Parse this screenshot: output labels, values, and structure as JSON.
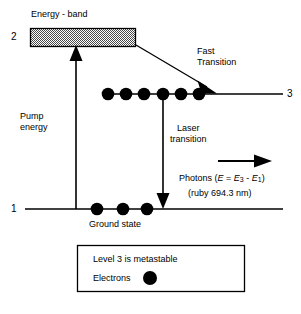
{
  "diagram": {
    "title_text": "Energy - band",
    "levels": [
      {
        "id": "level-2",
        "label": "2"
      },
      {
        "id": "level-3",
        "label": "3"
      },
      {
        "id": "level-1",
        "label": "1"
      }
    ],
    "annotations": {
      "energy_band": "Energy - band",
      "pump_energy_line1": "Pump",
      "pump_energy_line2": "energy",
      "fast_transition_line1": "Fast",
      "fast_transition_line2": "Transition",
      "laser_transition_line1": "Laser",
      "laser_transition_line2": "transition",
      "ground_state": "Ground state",
      "photons_prefix": "Photons (",
      "photons_e": "E",
      "photons_eq": " = ",
      "photons_e3": "E",
      "photons_sub3": "3",
      "photons_minus": " - ",
      "photons_e1": "E",
      "photons_sub1": "1",
      "photons_suffix": ")",
      "ruby_wavelength": "(ruby 694.3 nm)"
    },
    "legend": {
      "line1": "Level 3 is metastable",
      "line2": "Electrons",
      "electron_marker": "filled-circle"
    },
    "electrons": {
      "level3_count": 6,
      "level1_count": 3
    },
    "colors": {
      "stroke": "#000000",
      "band_fill": "#b0b0b0",
      "background": "#ffffff",
      "electron": "#000000"
    }
  }
}
